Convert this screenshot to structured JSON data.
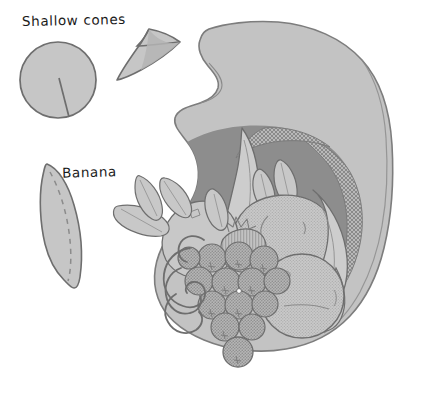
{
  "illustration": {
    "title": "Cornucopia craft pattern illustration",
    "style": "grayscale hand-drawn line art with halftone stipple shading",
    "background_color": "#ffffff"
  },
  "labels": [
    {
      "id": "shallow-cones",
      "text": "Shallow cones",
      "describes": "circle pattern piece with radial slit and the folded shallow cone made from it"
    },
    {
      "id": "banana",
      "text": "Banana",
      "describes": "crescent pattern piece with dashed fold line"
    }
  ],
  "pattern_pieces": [
    {
      "name": "slit-circle",
      "label": "Shallow cones",
      "shape": "circle",
      "detail": "solid line slit from centre to lower-right edge",
      "fill": "#c6c6c6",
      "stroke": "#6e6e6e"
    },
    {
      "name": "folded-cone",
      "label": "Shallow cones",
      "shape": "shallow folded cone",
      "detail": "overlapped edges of the slit circle forming a low cone",
      "fill": "#c6c6c6",
      "stroke": "#6e6e6e"
    },
    {
      "name": "banana-crescent",
      "label": "Banana",
      "shape": "crescent",
      "detail": "dashed fold line running lengthwise down the middle",
      "fill": "#c6c6c6",
      "stroke": "#6e6e6e"
    }
  ],
  "cornucopia": {
    "name": "cornucopia-horn",
    "description": "Horn of plenty opening to the left with curled tip at top left",
    "horn_fill": "#c3c3c3",
    "horn_stroke": "#7d7d7d",
    "interior_shadow": "#8d8d8d",
    "rim_texture": "cross-hatch",
    "contents": [
      {
        "name": "banana-bunch",
        "count": 3,
        "note": "long curved bananas across the mouth"
      },
      {
        "name": "apple",
        "count": 2
      },
      {
        "name": "pear",
        "count": 1
      },
      {
        "name": "orange",
        "count": 2
      },
      {
        "name": "grape-cluster",
        "count": 1,
        "grapes": 14,
        "note": "with curling vine tendrils"
      },
      {
        "name": "leaf",
        "count": 6
      },
      {
        "name": "pinecone",
        "count": 1
      },
      {
        "name": "single-hanging-grape",
        "count": 1
      }
    ]
  },
  "palette": {
    "background": "#ffffff",
    "light_gray": "#c6c6c6",
    "mid_gray": "#b2b2b2",
    "dark_gray": "#8d8d8d",
    "outline": "#6e6e6e",
    "text": "#1b1b1b"
  }
}
